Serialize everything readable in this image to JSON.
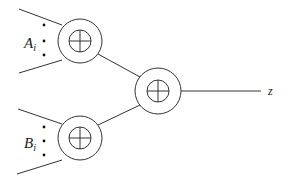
{
  "diagram": {
    "type": "adder-tree",
    "colors": {
      "stroke": "#333333",
      "background": "#ffffff",
      "text": "#222222"
    },
    "nodes": [
      {
        "id": "adder-top",
        "symbol": "circled-plus",
        "cx": 80,
        "cy": 41
      },
      {
        "id": "adder-bottom",
        "symbol": "circled-plus",
        "cx": 80,
        "cy": 138
      },
      {
        "id": "adder-out",
        "symbol": "circled-plus",
        "cx": 158,
        "cy": 91
      }
    ],
    "inputs": [
      {
        "group": "top",
        "label_main": "A",
        "label_sub": "i"
      },
      {
        "group": "bottom",
        "label_main": "B",
        "label_sub": "i"
      }
    ],
    "output": {
      "label": "z"
    }
  }
}
